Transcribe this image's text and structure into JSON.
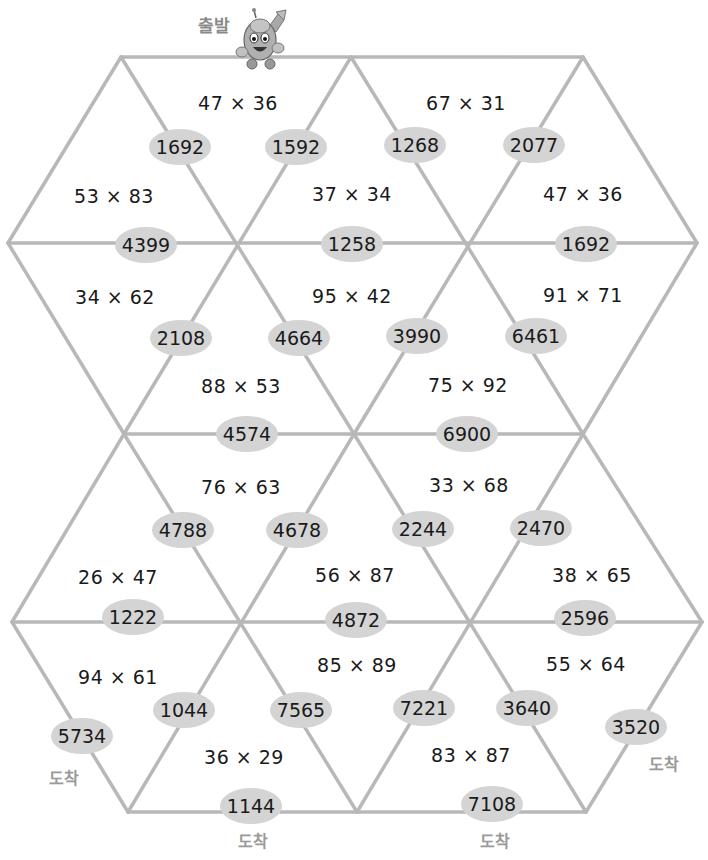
{
  "labels": {
    "start": "출발",
    "end_left": "도착",
    "end_bottom_left": "도착",
    "end_bottom_right": "도착",
    "end_right": "도착"
  },
  "colors": {
    "line": "#b8b8b8",
    "bubble": "#d4d4d4",
    "text": "#1a1a1a",
    "label": "#9a9a9a"
  },
  "triangles": [
    {
      "expr": "47 × 36"
    },
    {
      "expr": "67 × 31"
    },
    {
      "expr": "53 × 83"
    },
    {
      "expr": "37 × 34"
    },
    {
      "expr": "47 × 36"
    },
    {
      "expr": "34 × 62"
    },
    {
      "expr": "95 × 42"
    },
    {
      "expr": "91 × 71"
    },
    {
      "expr": "88 × 53"
    },
    {
      "expr": "75 × 92"
    },
    {
      "expr": "76 × 63"
    },
    {
      "expr": "33 × 68"
    },
    {
      "expr": "26 × 47"
    },
    {
      "expr": "56 × 87"
    },
    {
      "expr": "38 × 65"
    },
    {
      "expr": "94 × 61"
    },
    {
      "expr": "85 × 89"
    },
    {
      "expr": "55 × 64"
    },
    {
      "expr": "36 × 29"
    },
    {
      "expr": "83 × 87"
    }
  ],
  "answers": [
    {
      "value": "1692"
    },
    {
      "value": "1592"
    },
    {
      "value": "1268"
    },
    {
      "value": "2077"
    },
    {
      "value": "4399"
    },
    {
      "value": "1258"
    },
    {
      "value": "1692"
    },
    {
      "value": "2108"
    },
    {
      "value": "4664"
    },
    {
      "value": "3990"
    },
    {
      "value": "6461"
    },
    {
      "value": "4574"
    },
    {
      "value": "6900"
    },
    {
      "value": "4788"
    },
    {
      "value": "4678"
    },
    {
      "value": "2244"
    },
    {
      "value": "2470"
    },
    {
      "value": "1222"
    },
    {
      "value": "4872"
    },
    {
      "value": "2596"
    },
    {
      "value": "5734"
    },
    {
      "value": "1044"
    },
    {
      "value": "7565"
    },
    {
      "value": "7221"
    },
    {
      "value": "3640"
    },
    {
      "value": "3520"
    },
    {
      "value": "1144"
    },
    {
      "value": "7108"
    }
  ]
}
